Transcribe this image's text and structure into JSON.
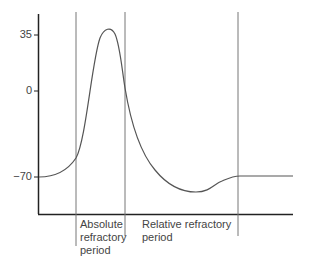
{
  "diagram": {
    "type": "action-potential",
    "y_ticks": [
      {
        "label": "35",
        "value": 35
      },
      {
        "label": "0",
        "value": 0
      },
      {
        "label": "−70",
        "value": -70
      }
    ],
    "regions": [
      {
        "label": "Absolute\nrefractory\nperiod"
      },
      {
        "label": "Relative refractory\nperiod"
      }
    ],
    "colors": {
      "axis": "#222222",
      "curve": "#555555",
      "divider": "#777777",
      "text": "#444444"
    }
  }
}
